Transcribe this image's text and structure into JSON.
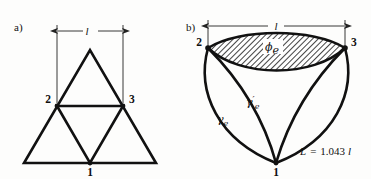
{
  "figure": {
    "background_color": "#fdfdfc",
    "ink_color": "#111111",
    "hatch_color": "#3a3a3a",
    "panels": [
      {
        "id": "a",
        "label": "a)",
        "description": "straight-edged equilateral triangle network",
        "dimension_label": "l",
        "vertices": [
          {
            "name": "2",
            "label": "2",
            "x": 57,
            "y": 106
          },
          {
            "name": "3",
            "label": "3",
            "x": 123,
            "y": 106
          },
          {
            "name": "1",
            "label": "1",
            "x": 90,
            "y": 163
          }
        ]
      },
      {
        "id": "b",
        "label": "b)",
        "description": "curvilinear Reuleaux-style triangle with hatched lens region",
        "dimension_label": "l",
        "vertices": [
          {
            "name": "2",
            "label": "2",
            "x": 208,
            "y": 48
          },
          {
            "name": "3",
            "label": "3",
            "x": 345,
            "y": 48
          },
          {
            "name": "1",
            "label": "1",
            "x": 276,
            "y": 163
          }
        ],
        "region_label": "ϕ",
        "region_label_sub": "e",
        "curve_inner_label": "γ",
        "curve_inner_label_prime": "′",
        "curve_inner_label_sub": "e",
        "curve_outer_label": "γ",
        "curve_outer_label_sub": "e",
        "equation": "L = 1.043 l",
        "equation_parts": {
          "lhs": "L",
          "equals": "=",
          "coefficient": "1.043",
          "unit": "l"
        }
      }
    ]
  }
}
